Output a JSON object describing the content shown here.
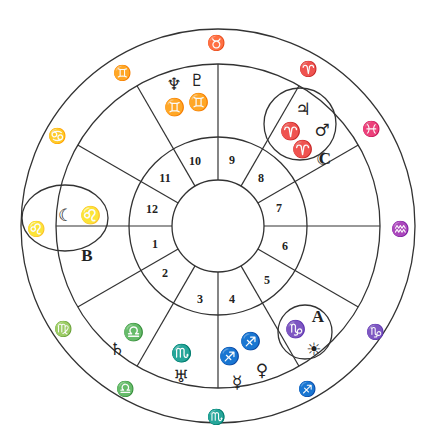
{
  "chart_title": "Natal chart wheel",
  "colors": {
    "line": "#333333",
    "ink": "#222222",
    "background": "#ffffff"
  },
  "wheel": {
    "center": [
      218,
      226
    ],
    "radii": {
      "outer": 197,
      "sign_ring": 162,
      "house_ring": 89,
      "inner": 46
    }
  },
  "houses": [
    {
      "n": "1",
      "x": 155,
      "y": 248
    },
    {
      "n": "2",
      "x": 165,
      "y": 277
    },
    {
      "n": "3",
      "x": 200,
      "y": 303
    },
    {
      "n": "4",
      "x": 232,
      "y": 303
    },
    {
      "n": "5",
      "x": 267,
      "y": 284
    },
    {
      "n": "6",
      "x": 285,
      "y": 250
    },
    {
      "n": "7",
      "x": 279,
      "y": 212
    },
    {
      "n": "8",
      "x": 261,
      "y": 182
    },
    {
      "n": "9",
      "x": 232,
      "y": 164
    },
    {
      "n": "10",
      "x": 195,
      "y": 165
    },
    {
      "n": "11",
      "x": 165,
      "y": 182
    },
    {
      "n": "12",
      "x": 152,
      "y": 213
    }
  ],
  "outer_signs": [
    {
      "name": "taurus",
      "glyph": "♉",
      "x": 216,
      "y": 44
    },
    {
      "name": "aries",
      "glyph": "♈",
      "x": 308,
      "y": 70
    },
    {
      "name": "pisces",
      "glyph": "♓",
      "x": 371,
      "y": 130
    },
    {
      "name": "aquarius",
      "glyph": "♒",
      "x": 400,
      "y": 230
    },
    {
      "name": "capricorn",
      "glyph": "♑",
      "x": 375,
      "y": 333
    },
    {
      "name": "sagittarius",
      "glyph": "♐",
      "x": 307,
      "y": 390
    },
    {
      "name": "scorpio",
      "glyph": "♏",
      "x": 216,
      "y": 418
    },
    {
      "name": "libra",
      "glyph": "♎",
      "x": 125,
      "y": 390
    },
    {
      "name": "virgo",
      "glyph": "♍",
      "x": 63,
      "y": 330
    },
    {
      "name": "leo",
      "glyph": "♌",
      "x": 36,
      "y": 230
    },
    {
      "name": "cancer",
      "glyph": "♋",
      "x": 57,
      "y": 137
    },
    {
      "name": "gemini",
      "glyph": "♊",
      "x": 122,
      "y": 74
    }
  ],
  "placements": [
    {
      "name": "neptune",
      "glyph": "♆",
      "x": 174,
      "y": 85
    },
    {
      "name": "pluto",
      "glyph": "♇",
      "x": 197,
      "y": 81
    },
    {
      "name": "gemini-sign-neptune",
      "glyph": "♊",
      "x": 174,
      "y": 108
    },
    {
      "name": "gemini-sign-pluto",
      "glyph": "♊",
      "x": 198,
      "y": 103
    },
    {
      "name": "jupiter",
      "glyph": "♃",
      "x": 303,
      "y": 110
    },
    {
      "name": "mars",
      "glyph": "♂",
      "x": 322,
      "y": 131
    },
    {
      "name": "aries-sign-1",
      "glyph": "♈",
      "x": 290,
      "y": 132
    },
    {
      "name": "aries-sign-2",
      "glyph": "♈",
      "x": 302,
      "y": 150
    },
    {
      "name": "moon-c",
      "glyph": "☾",
      "x": 323,
      "y": 160
    },
    {
      "name": "moon",
      "glyph": "☾",
      "x": 65,
      "y": 216
    },
    {
      "name": "leo-sign",
      "glyph": "♌",
      "x": 90,
      "y": 216
    },
    {
      "name": "libra-sign-saturn",
      "glyph": "♎",
      "x": 133,
      "y": 333
    },
    {
      "name": "saturn",
      "glyph": "♄",
      "x": 117,
      "y": 350
    },
    {
      "name": "scorpio-sign-uranus",
      "glyph": "♏",
      "x": 181,
      "y": 354
    },
    {
      "name": "uranus",
      "glyph": "♅",
      "x": 181,
      "y": 377
    },
    {
      "name": "sagittarius-sign-1",
      "glyph": "♐",
      "x": 229,
      "y": 357
    },
    {
      "name": "sagittarius-sign-2",
      "glyph": "♐",
      "x": 250,
      "y": 342
    },
    {
      "name": "mercury",
      "glyph": "☿",
      "x": 237,
      "y": 383
    },
    {
      "name": "venus",
      "glyph": "♀",
      "x": 262,
      "y": 371
    },
    {
      "name": "capricorn-sign-sun",
      "glyph": "♑",
      "x": 295,
      "y": 330
    },
    {
      "name": "sun",
      "glyph": "☀",
      "x": 314,
      "y": 350
    }
  ],
  "highlights": [
    {
      "label": "A",
      "shape": "circle",
      "cx": 305,
      "cy": 332,
      "r": 27,
      "lx": 318,
      "ly": 318
    },
    {
      "label": "B",
      "shape": "ellipse",
      "cx": 65,
      "cy": 218,
      "rx": 43,
      "ry": 33,
      "lx": 87,
      "ly": 257
    },
    {
      "label": "C",
      "shape": "circle",
      "cx": 300,
      "cy": 124,
      "r": 36,
      "lx": 325,
      "ly": 160
    }
  ]
}
